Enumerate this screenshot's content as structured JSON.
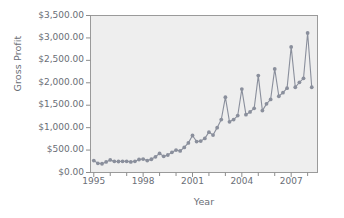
{
  "chart_data": {
    "type": "line",
    "title": "",
    "xlabel": "Year",
    "ylabel": "Gross Profit",
    "grid": false,
    "legend": "none",
    "marker": "circle",
    "series_color": "#8a8f9c",
    "plot_background": "#eeeeee",
    "xlim": [
      1994.8,
      2008.6
    ],
    "ylim": [
      0,
      3500
    ],
    "ytick_labels": [
      "$3,500.00",
      "$3,000.00",
      "$2,500.00",
      "$2,000.00",
      "$1,500.00",
      "$1,000.00",
      "$500.00",
      "$0.00"
    ],
    "ytick_values": [
      3500,
      3000,
      2500,
      2000,
      1500,
      1000,
      500,
      0
    ],
    "xtick_labels": [
      "1995",
      "1998",
      "2001",
      "2004",
      "2007"
    ],
    "xtick_values": [
      1995,
      1998,
      2001,
      2004,
      2007
    ],
    "xtick_minor_values": [
      1996,
      1997,
      1999,
      2000,
      2002,
      2003,
      2005,
      2006,
      2008
    ],
    "x": [
      1995.0,
      1995.25,
      1995.5,
      1995.75,
      1996.0,
      1996.25,
      1996.5,
      1996.75,
      1997.0,
      1997.25,
      1997.5,
      1997.75,
      1998.0,
      1998.25,
      1998.5,
      1998.75,
      1999.0,
      1999.25,
      1999.5,
      1999.75,
      2000.0,
      2000.25,
      2000.5,
      2000.75,
      2001.0,
      2001.25,
      2001.5,
      2001.75,
      2002.0,
      2002.25,
      2002.5,
      2002.75,
      2003.0,
      2003.25,
      2003.5,
      2003.75,
      2004.0,
      2004.25,
      2004.5,
      2004.75,
      2005.0,
      2005.25,
      2005.5,
      2005.75,
      2006.0,
      2006.25,
      2006.5,
      2006.75,
      2007.0,
      2007.25,
      2007.5,
      2007.75,
      2008.0,
      2008.25
    ],
    "values": [
      265,
      205,
      195,
      235,
      280,
      250,
      245,
      250,
      250,
      235,
      250,
      290,
      300,
      265,
      295,
      350,
      425,
      360,
      390,
      450,
      500,
      480,
      560,
      660,
      825,
      690,
      700,
      760,
      900,
      835,
      1000,
      1180,
      1680,
      1130,
      1180,
      1270,
      1860,
      1290,
      1350,
      1430,
      2160,
      1380,
      1530,
      1630,
      2310,
      1700,
      1780,
      1880,
      2800,
      1900,
      2010,
      2100,
      3110,
      1900
    ],
    "series_label": "Gross Profit"
  }
}
